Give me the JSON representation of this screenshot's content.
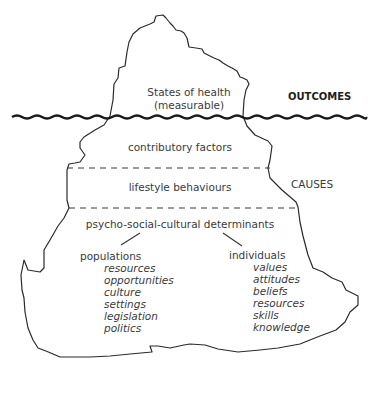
{
  "diagram": {
    "type": "iceberg",
    "above_water": {
      "label_line1": "States of health",
      "label_line2": "(measurable)",
      "side_label": "OUTCOMES"
    },
    "below_water": {
      "side_label": "CAUSES",
      "layers": [
        {
          "label": "contributory factors"
        },
        {
          "label": "lifestyle behaviours"
        },
        {
          "label": "psycho-social-cultural determinants"
        }
      ],
      "branches": [
        {
          "label": "populations",
          "items": [
            "resources",
            "opportunities",
            "culture",
            "settings",
            "legislation",
            "politics"
          ]
        },
        {
          "label": "individuals",
          "items": [
            "values",
            "attitudes",
            "beliefs",
            "resources",
            "skills",
            "knowledge"
          ]
        }
      ]
    }
  }
}
